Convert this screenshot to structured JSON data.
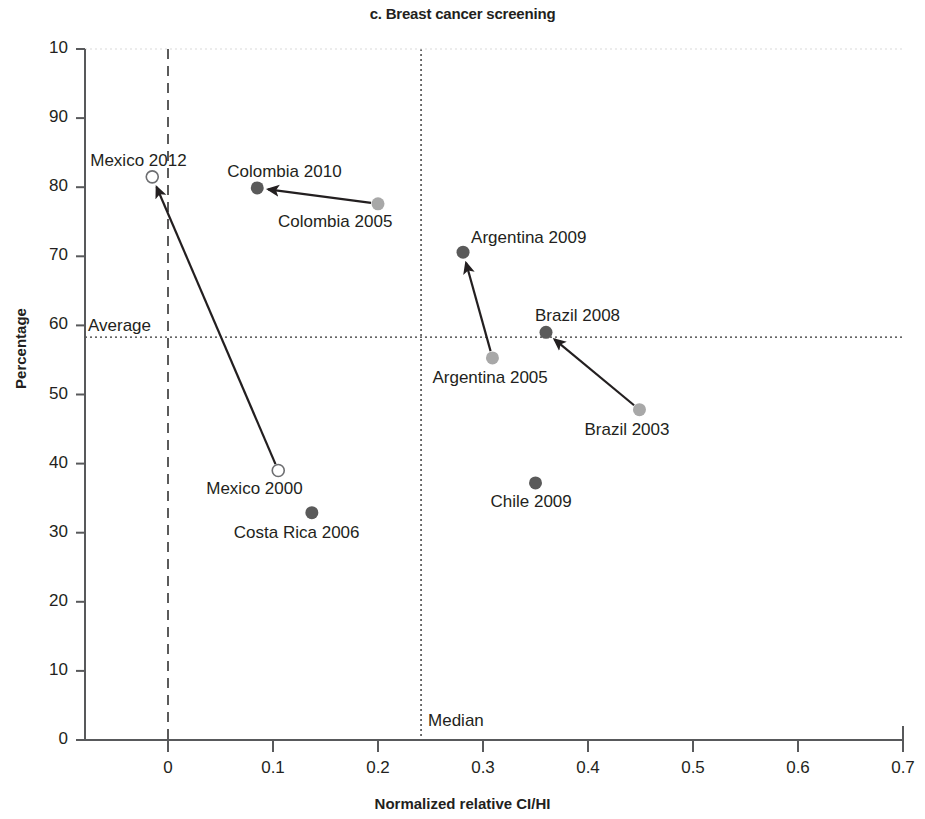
{
  "chart_data": {
    "type": "scatter",
    "title": "c. Breast cancer screening",
    "xlabel": "Normalized relative CI/HI",
    "ylabel": "Percentage",
    "xlim": [
      -0.08,
      0.72
    ],
    "ylim": [
      0,
      100
    ],
    "xticks": [
      "0",
      "0.1",
      "0.2",
      "0.3",
      "0.4",
      "0.5",
      "0.6",
      "0.7"
    ],
    "xtick_values": [
      0,
      0.1,
      0.2,
      0.3,
      0.4,
      0.5,
      0.6,
      0.7
    ],
    "yticks": [
      "0",
      "10",
      "20",
      "30",
      "40",
      "50",
      "60",
      "70",
      "80",
      "90",
      "10"
    ],
    "ytick_values": [
      0,
      10,
      20,
      30,
      40,
      50,
      60,
      70,
      80,
      90,
      100
    ],
    "grid": false,
    "legend": "none",
    "reference_lines": [
      {
        "name": "average",
        "label": "Average",
        "orientation": "horizontal",
        "value": 58.3,
        "style": "dotted"
      },
      {
        "name": "median",
        "label": "Median",
        "orientation": "vertical",
        "value": 0.241,
        "style": "dotted"
      },
      {
        "name": "zero-vertical",
        "label": "",
        "orientation": "vertical",
        "value": 0,
        "style": "dashed"
      },
      {
        "name": "zero-horizontal",
        "label": "",
        "orientation": "horizontal",
        "value": 0,
        "style": "dashed"
      }
    ],
    "points": [
      {
        "label": "Mexico 2012",
        "x": -0.015,
        "y": 81.5,
        "marker": "open",
        "color": "#ffffff",
        "label_dx": -62,
        "label_dy": -26
      },
      {
        "label": "Mexico 2000",
        "x": 0.105,
        "y": 39.0,
        "marker": "open",
        "color": "#ffffff",
        "label_dx": -72,
        "label_dy": 8
      },
      {
        "label": "Colombia 2010",
        "x": 0.085,
        "y": 79.9,
        "marker": "dark",
        "color": "#5a5a5a",
        "label_dx": -30,
        "label_dy": -26
      },
      {
        "label": "Colombia 2005",
        "x": 0.2,
        "y": 77.6,
        "marker": "light",
        "color": "#a8a8a8",
        "label_dx": -100,
        "label_dy": 8
      },
      {
        "label": "Argentina 2009",
        "x": 0.281,
        "y": 70.6,
        "marker": "dark",
        "color": "#5a5a5a",
        "label_dx": 8,
        "label_dy": -24
      },
      {
        "label": "Argentina 2005",
        "x": 0.309,
        "y": 55.3,
        "marker": "light",
        "color": "#a8a8a8",
        "label_dx": -60,
        "label_dy": 10
      },
      {
        "label": "Brazil 2008",
        "x": 0.36,
        "y": 59.0,
        "marker": "dark",
        "color": "#5a5a5a",
        "label_dx": -11,
        "label_dy": -26
      },
      {
        "label": "Brazil 2003",
        "x": 0.449,
        "y": 47.8,
        "marker": "light",
        "color": "#a8a8a8",
        "label_dx": -55,
        "label_dy": 10
      },
      {
        "label": "Chile 2009",
        "x": 0.35,
        "y": 37.2,
        "marker": "dark",
        "color": "#5a5a5a",
        "label_dx": -45,
        "label_dy": 9
      },
      {
        "label": "Costa Rica 2006",
        "x": 0.137,
        "y": 32.9,
        "marker": "dark",
        "color": "#5a5a5a",
        "label_dx": -78,
        "label_dy": 10
      }
    ],
    "arrows": [
      {
        "name": "mexico-2000-to-2012",
        "from": "Mexico 2000",
        "to": "Mexico 2012"
      },
      {
        "name": "colombia-2005-to-2010",
        "from": "Colombia 2005",
        "to": "Colombia 2010"
      },
      {
        "name": "argentina-2005-to-2009",
        "from": "Argentina 2005",
        "to": "Argentina 2009"
      },
      {
        "name": "brazil-2003-to-2008",
        "from": "Brazil 2003",
        "to": "Brazil 2008"
      }
    ],
    "axis_color": "#58595b",
    "marker_dark_color": "#5a5a5a",
    "marker_light_color": "#a8a8a8"
  }
}
